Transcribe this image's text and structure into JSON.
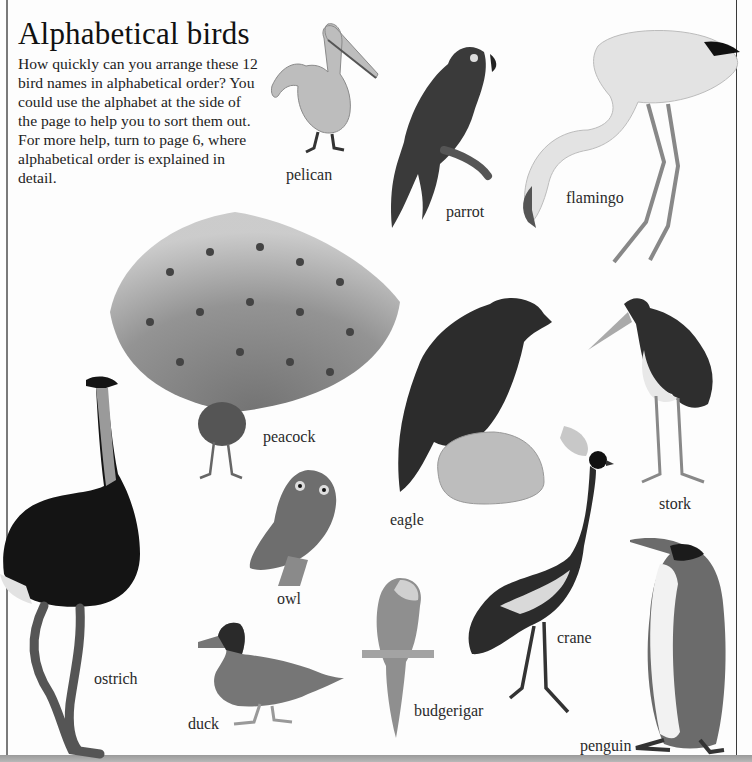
{
  "page": {
    "title": "Alphabetical birds",
    "intro": "How quickly can you arrange these 12 bird names in alphabetical order? You could use the alphabet at the side of the page to help you to sort them out. For more help, turn to page 6, where alphabetical order is explained in detail."
  },
  "birds": [
    {
      "name": "pelican"
    },
    {
      "name": "parrot"
    },
    {
      "name": "flamingo"
    },
    {
      "name": "peacock"
    },
    {
      "name": "eagle"
    },
    {
      "name": "stork"
    },
    {
      "name": "owl"
    },
    {
      "name": "ostrich"
    },
    {
      "name": "crane"
    },
    {
      "name": "duck"
    },
    {
      "name": "budgerigar"
    },
    {
      "name": "penguin"
    }
  ],
  "colors": {
    "background": "#fdfdfd",
    "text": "#1e1e1e",
    "rule": "#7a7a7a",
    "image_tone": "grayscale"
  }
}
